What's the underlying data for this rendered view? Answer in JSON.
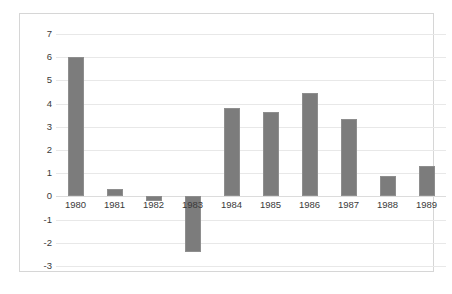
{
  "chart_data": {
    "type": "bar",
    "title": "",
    "subtitle": "",
    "xlabel": "",
    "ylabel": "",
    "categories": [
      "1980",
      "1981",
      "1982",
      "1983",
      "1984",
      "1985",
      "1986",
      "1987",
      "1988",
      "1989"
    ],
    "values": [
      6.0,
      0.3,
      -0.2,
      -2.4,
      3.8,
      3.65,
      4.45,
      3.35,
      0.9,
      1.3
    ],
    "series": [
      {
        "name": "",
        "values": [
          6.0,
          0.3,
          -0.2,
          -2.4,
          3.8,
          3.65,
          4.45,
          3.35,
          0.9,
          1.3
        ]
      }
    ],
    "ylim": [
      -3,
      7
    ],
    "ytick_labels": [
      "7",
      "6",
      "5",
      "4",
      "3",
      "2",
      "1",
      "0",
      "-1",
      "-2",
      "-3"
    ],
    "ytick_values": [
      7,
      6,
      5,
      4,
      3,
      2,
      1,
      0,
      -1,
      -2,
      -3
    ],
    "y_tick_step": 1,
    "grid": "horizontal",
    "vertical_grid": false,
    "legend": false,
    "legend_position": "none",
    "bar_color": "#7c7c7c",
    "bar_border_color": "#8e8e8e",
    "gridline_color": "#e8e8e8",
    "zero_line_color": "#dcdcdc",
    "frame_border_color": "#d6d6d6",
    "background_color": "#ffffff",
    "tick_label_color": "#3a3a3a",
    "x_label_position": "low"
  }
}
